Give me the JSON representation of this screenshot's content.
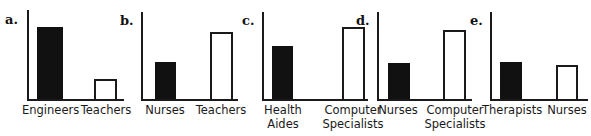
{
  "figure": {
    "width": 591,
    "height": 136,
    "background": "#ffffff",
    "ink_color": "#1a1a1a",
    "filled_bar_color": "#111111",
    "open_bar_color": "#ffffff"
  },
  "chart_data": [
    {
      "type": "bar",
      "panel": "a.",
      "title": "",
      "xlabel": "",
      "ylabel": "",
      "grid": false,
      "legend": "none",
      "ylim": [
        0,
        100
      ],
      "categories": [
        "Engineers",
        "Teachers"
      ],
      "values": [
        82,
        23
      ],
      "styles": [
        "filled",
        "open"
      ]
    },
    {
      "type": "bar",
      "panel": "b.",
      "title": "",
      "xlabel": "",
      "ylabel": "",
      "grid": false,
      "legend": "none",
      "ylim": [
        0,
        100
      ],
      "categories": [
        "Nurses",
        "Teachers"
      ],
      "values": [
        42,
        76
      ],
      "styles": [
        "filled",
        "open"
      ]
    },
    {
      "type": "bar",
      "panel": "c.",
      "title": "",
      "xlabel": "",
      "ylabel": "",
      "grid": false,
      "legend": "none",
      "ylim": [
        0,
        100
      ],
      "categories": [
        "Health\nAides",
        "Computer\nSpecialists"
      ],
      "values": [
        60,
        82
      ],
      "styles": [
        "filled",
        "open"
      ]
    },
    {
      "type": "bar",
      "panel": "d.",
      "title": "",
      "xlabel": "",
      "ylabel": "",
      "grid": false,
      "legend": "none",
      "ylim": [
        0,
        100
      ],
      "categories": [
        "Nurses",
        "Computer\nSpecialists"
      ],
      "values": [
        41,
        78
      ],
      "styles": [
        "filled",
        "open"
      ]
    },
    {
      "type": "bar",
      "panel": "e.",
      "title": "",
      "xlabel": "",
      "ylabel": "",
      "grid": false,
      "legend": "none",
      "ylim": [
        0,
        100
      ],
      "categories": [
        "Therapists",
        "Nurses"
      ],
      "values": [
        42,
        38
      ],
      "styles": [
        "filled",
        "open"
      ]
    }
  ],
  "panels": [
    {
      "letter": "a.",
      "left": 0,
      "axis_x": 27,
      "axis_top": 10,
      "baseline": 99,
      "axis_right": 124,
      "letter_x": 5,
      "letter_y": 13,
      "bars": [
        {
          "label": "Engineers",
          "style": "filled",
          "x": 37,
          "width": 26,
          "top": 27,
          "label_x": 22,
          "label_w": 56
        },
        {
          "label": "Teachers",
          "style": "open",
          "x": 94,
          "width": 23,
          "top": 79,
          "label_x": 78,
          "label_w": 56
        }
      ]
    },
    {
      "letter": "b.",
      "left": 0,
      "axis_x": 141,
      "axis_top": 12,
      "baseline": 99,
      "axis_right": 238,
      "letter_x": 120,
      "letter_y": 14,
      "bars": [
        {
          "label": "Nurses",
          "style": "filled",
          "x": 155,
          "width": 21,
          "top": 62,
          "label_x": 139,
          "label_w": 52
        },
        {
          "label": "Teachers",
          "style": "open",
          "x": 210,
          "width": 23,
          "top": 32,
          "label_x": 194,
          "label_w": 54
        }
      ]
    },
    {
      "letter": "c.",
      "left": 0,
      "axis_x": 262,
      "axis_top": 12,
      "baseline": 99,
      "axis_right": 368,
      "letter_x": 242,
      "letter_y": 14,
      "bars": [
        {
          "label": "Health\nAides",
          "style": "filled",
          "x": 272,
          "width": 21,
          "top": 46,
          "label_x": 255,
          "label_w": 56
        },
        {
          "label": "Computer\nSpecialists",
          "style": "open",
          "x": 342,
          "width": 23,
          "top": 27,
          "label_x": 315,
          "label_w": 76
        }
      ]
    },
    {
      "letter": "d.",
      "left": 0,
      "axis_x": 377,
      "axis_top": 12,
      "baseline": 99,
      "axis_right": 472,
      "letter_x": 356,
      "letter_y": 14,
      "bars": [
        {
          "label": "Nurses",
          "style": "filled",
          "x": 388,
          "width": 22,
          "top": 63,
          "label_x": 372,
          "label_w": 52
        },
        {
          "label": "Computer\nSpecialists",
          "style": "open",
          "x": 443,
          "width": 23,
          "top": 30,
          "label_x": 417,
          "label_w": 76
        }
      ]
    },
    {
      "letter": "e.",
      "left": 0,
      "axis_x": 490,
      "axis_top": 12,
      "baseline": 99,
      "axis_right": 588,
      "letter_x": 470,
      "letter_y": 14,
      "bars": [
        {
          "label": "Therapists",
          "style": "filled",
          "x": 500,
          "width": 22,
          "top": 62,
          "label_x": 482,
          "label_w": 60
        },
        {
          "label": "Nurses",
          "style": "open",
          "x": 556,
          "width": 22,
          "top": 65,
          "label_x": 541,
          "label_w": 52
        }
      ]
    }
  ]
}
